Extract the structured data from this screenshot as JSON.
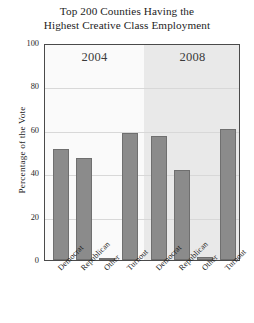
{
  "chart_data": {
    "type": "bar",
    "title": "Top 200 Counties Having the Highest Creative Class Employment",
    "title_line1": "Top 200 Counties Having the",
    "title_line2": "Highest Creative Class Employment",
    "xlabel": "",
    "ylabel": "Percentage of the Vote",
    "ylim": [
      0,
      100
    ],
    "yticks": [
      0,
      20,
      40,
      60,
      80,
      100
    ],
    "ytick_labels": [
      "0",
      "20",
      "40",
      "60",
      "80",
      "100"
    ],
    "grid": true,
    "legend": "none",
    "panels": [
      {
        "label": "2004",
        "categories": [
          "Democrat",
          "Republican",
          "Other",
          "Turnout"
        ],
        "values": [
          51,
          47,
          1,
          58.5
        ]
      },
      {
        "label": "2008",
        "categories": [
          "Democrat",
          "Republican",
          "Other",
          "Turnout"
        ],
        "values": [
          57,
          41.5,
          1.5,
          60.5
        ]
      }
    ],
    "categories": [
      "Democrat",
      "Republican",
      "Other",
      "Turnout"
    ],
    "series": [
      {
        "name": "2004",
        "values": [
          51,
          47,
          1,
          58.5
        ]
      },
      {
        "name": "2008",
        "values": [
          57,
          41.5,
          1.5,
          60.5
        ]
      }
    ],
    "colors": {
      "bar_fill": "#8b8b8b",
      "bar_stroke": "#6f6f6f",
      "panel_2004_bg": "#fafafa",
      "panel_2008_bg": "#e9e9e9",
      "gridline": "#d8d8d8",
      "axis": "#4a4a4a",
      "text": "#1d1d1d"
    }
  }
}
